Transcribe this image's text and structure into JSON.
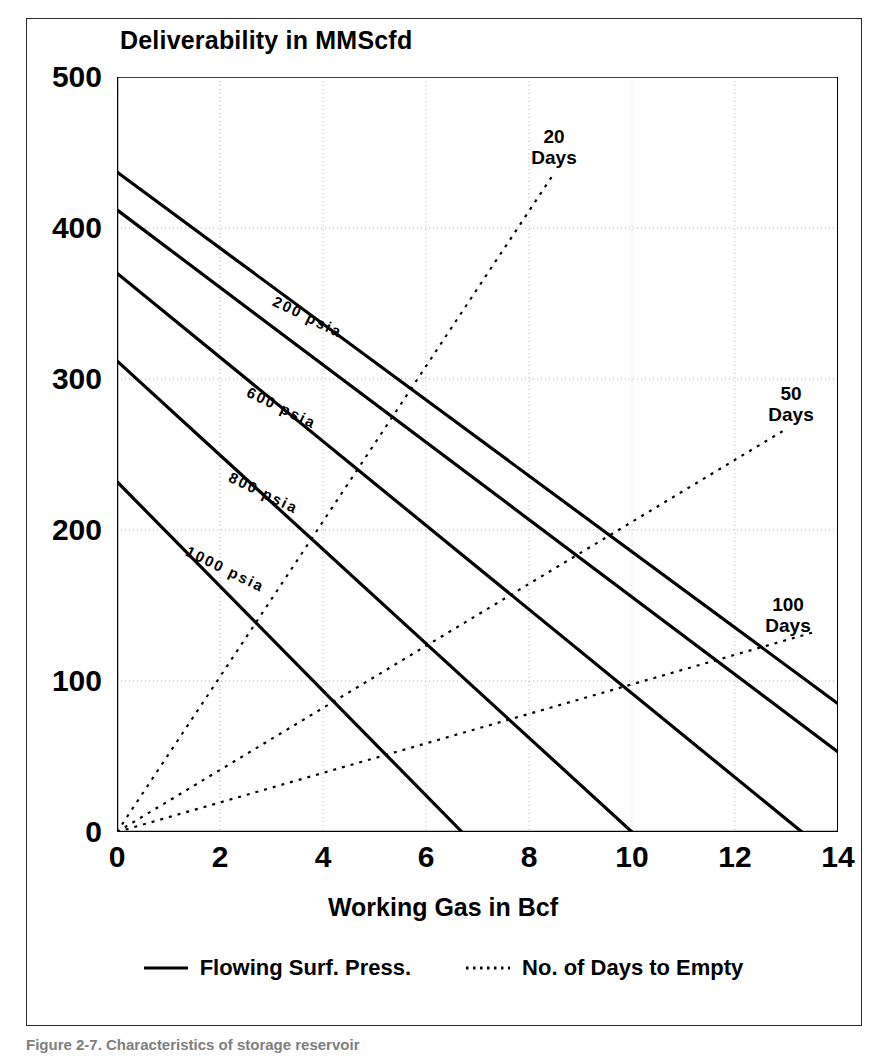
{
  "chart_data": {
    "type": "line",
    "title": "Deliverability in MMScfd",
    "xlabel": "Working Gas in Bcf",
    "ylabel": "Deliverability in MMScfd",
    "xlim": [
      0,
      14
    ],
    "ylim": [
      0,
      500
    ],
    "xticks": [
      0,
      2,
      4,
      6,
      8,
      10,
      12,
      14
    ],
    "yticks": [
      0,
      100,
      200,
      300,
      400,
      500
    ],
    "grid": true,
    "grid_style": "dotted",
    "legend_position": "below-plot",
    "series": [
      {
        "name": "Flowing Surf. Press. (upper, unlabeled)",
        "style": "solid",
        "label": "",
        "x": [
          0,
          14
        ],
        "y": [
          437,
          85
        ]
      },
      {
        "name": "200 psia",
        "style": "solid",
        "label": "200 psia",
        "x": [
          0,
          14
        ],
        "y": [
          412,
          53
        ]
      },
      {
        "name": "600 psia",
        "style": "solid",
        "label": "600 psia",
        "x": [
          0,
          13.3
        ],
        "y": [
          370,
          0
        ]
      },
      {
        "name": "800 psia",
        "style": "solid",
        "label": "800 psia",
        "x": [
          0,
          10
        ],
        "y": [
          312,
          0
        ]
      },
      {
        "name": "1000 psia",
        "style": "solid",
        "label": "1000 psia",
        "x": [
          0,
          6.7
        ],
        "y": [
          232,
          0
        ]
      },
      {
        "name": "20 Days",
        "style": "dotted",
        "label": "20 Days",
        "x": [
          0,
          8.5
        ],
        "y": [
          0,
          437
        ]
      },
      {
        "name": "50 Days",
        "style": "dotted",
        "label": "50 Days",
        "x": [
          0,
          13.0
        ],
        "y": [
          0,
          267
        ]
      },
      {
        "name": "100 Days",
        "style": "dotted",
        "label": "100 Days",
        "x": [
          0,
          13.6
        ],
        "y": [
          0,
          133
        ]
      }
    ],
    "annotations": [
      {
        "text": "200 psia",
        "x": 3.05,
        "y": 352,
        "rotation": 26
      },
      {
        "text": "600 psia",
        "x": 2.55,
        "y": 292,
        "rotation": 26
      },
      {
        "text": "800 psia",
        "x": 2.2,
        "y": 236,
        "rotation": 26
      },
      {
        "text": "1000 psia",
        "x": 1.35,
        "y": 187,
        "rotation": 26
      },
      {
        "text": "20 Days",
        "x": 8.35,
        "y": 470
      },
      {
        "text": "50 Days",
        "x": 12.95,
        "y": 300
      },
      {
        "text": "100 Days",
        "x": 12.85,
        "y": 160
      }
    ],
    "legend": [
      {
        "label": "Flowing Surf. Press.",
        "style": "solid"
      },
      {
        "label": "No. of Days to Empty",
        "style": "dotted"
      }
    ]
  },
  "title": {
    "text": "Deliverability in MMScfd"
  },
  "axes": {
    "x_title": "Working Gas in Bcf",
    "xticks": [
      "0",
      "2",
      "4",
      "6",
      "8",
      "10",
      "12",
      "14"
    ],
    "yticks": [
      "0",
      "100",
      "200",
      "300",
      "400",
      "500"
    ]
  },
  "curve_labels": {
    "p200": "200 psia",
    "p600": "600 psia",
    "p800": "800 psia",
    "p1000": "1000 psia"
  },
  "days_labels": {
    "d20_line1": "20",
    "d20_line2": "Days",
    "d50_line1": "50",
    "d50_line2": "Days",
    "d100_line1": "100",
    "d100_line2": "Days"
  },
  "legend": {
    "solid_label": "Flowing Surf. Press.",
    "dotted_label": "No. of Days to Empty"
  },
  "caption": {
    "text": "Figure 2-7. Characteristics of storage reservoir"
  },
  "colors": {
    "ink": "#000000",
    "frame": "#2b2b2b",
    "grid": "#b9b9b9"
  }
}
